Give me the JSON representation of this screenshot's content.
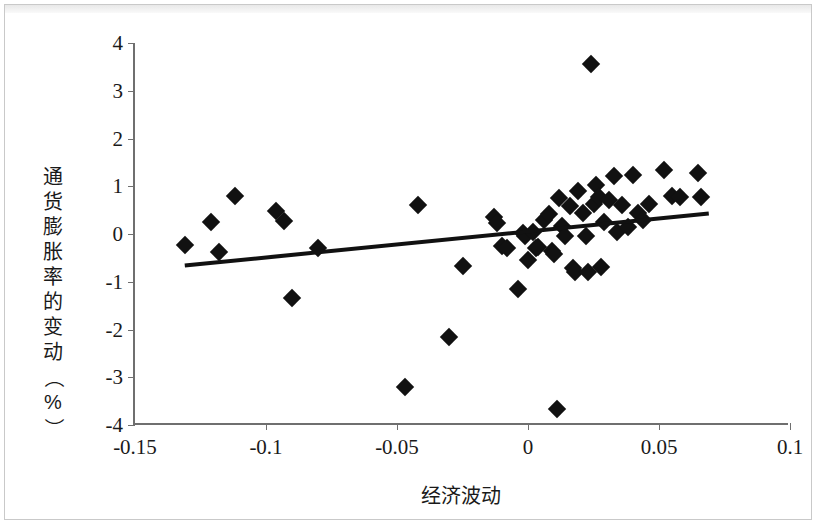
{
  "chart_data": {
    "type": "scatter",
    "title": "",
    "xlabel": "经济波动",
    "ylabel": "通货膨胀率的变动（%）",
    "ylabel_chars": [
      "通",
      "货",
      "膨",
      "胀",
      "率",
      "的",
      "变",
      "动",
      "（",
      "%",
      "）"
    ],
    "xlim": [
      -0.15,
      0.1
    ],
    "ylim": [
      -4,
      4
    ],
    "xticks": [
      -0.15,
      -0.1,
      -0.05,
      0,
      0.05,
      0.1
    ],
    "xticklabels": [
      "-0.15",
      "-0.1",
      "-0.05",
      "0",
      "0.05",
      "0.1"
    ],
    "yticks": [
      4,
      3,
      2,
      1,
      0,
      -1,
      -2,
      -3,
      -4
    ],
    "yticklabels": [
      "4",
      "3",
      "2",
      "1",
      "0",
      "-1",
      "-2",
      "-3",
      "-4"
    ],
    "grid": false,
    "legend": false,
    "marker": "diamond",
    "marker_color": "#111111",
    "axis_color": "#6f6f6f",
    "trendline": {
      "visible": true,
      "color": "#111111",
      "x_start": -0.131,
      "y_start": -0.66,
      "x_end": 0.069,
      "y_end": 0.43
    },
    "points": [
      [
        -0.131,
        -0.22
      ],
      [
        -0.121,
        0.25
      ],
      [
        -0.118,
        -0.37
      ],
      [
        -0.112,
        0.8
      ],
      [
        -0.096,
        0.48
      ],
      [
        -0.093,
        0.27
      ],
      [
        -0.09,
        -1.35
      ],
      [
        -0.08,
        -0.3
      ],
      [
        -0.047,
        -3.2
      ],
      [
        -0.042,
        0.61
      ],
      [
        -0.03,
        -2.15
      ],
      [
        -0.025,
        -0.67
      ],
      [
        -0.013,
        0.36
      ],
      [
        -0.012,
        0.22
      ],
      [
        -0.01,
        -0.25
      ],
      [
        -0.008,
        -0.3
      ],
      [
        -0.004,
        -1.15
      ],
      [
        -0.002,
        0.02
      ],
      [
        -0.001,
        -0.05
      ],
      [
        0.0,
        -0.55
      ],
      [
        0.002,
        0.05
      ],
      [
        0.003,
        -0.3
      ],
      [
        0.004,
        -0.28
      ],
      [
        0.006,
        0.3
      ],
      [
        0.008,
        0.42
      ],
      [
        0.009,
        -0.35
      ],
      [
        0.01,
        -0.42
      ],
      [
        0.011,
        -3.67
      ],
      [
        0.012,
        0.75
      ],
      [
        0.013,
        0.16
      ],
      [
        0.014,
        -0.05
      ],
      [
        0.016,
        0.58
      ],
      [
        0.017,
        -0.72
      ],
      [
        0.018,
        -0.8
      ],
      [
        0.019,
        0.9
      ],
      [
        0.021,
        0.44
      ],
      [
        0.022,
        -0.05
      ],
      [
        0.023,
        -0.8
      ],
      [
        0.024,
        3.57
      ],
      [
        0.025,
        0.62
      ],
      [
        0.026,
        1.02
      ],
      [
        0.027,
        0.78
      ],
      [
        0.028,
        -0.7
      ],
      [
        0.029,
        0.25
      ],
      [
        0.031,
        0.72
      ],
      [
        0.033,
        1.22
      ],
      [
        0.034,
        0.05
      ],
      [
        0.036,
        0.6
      ],
      [
        0.038,
        0.15
      ],
      [
        0.04,
        1.23
      ],
      [
        0.042,
        0.45
      ],
      [
        0.044,
        0.3
      ],
      [
        0.046,
        0.62
      ],
      [
        0.052,
        1.35
      ],
      [
        0.055,
        0.8
      ],
      [
        0.058,
        0.77
      ],
      [
        0.065,
        1.27
      ],
      [
        0.066,
        0.78
      ]
    ]
  }
}
